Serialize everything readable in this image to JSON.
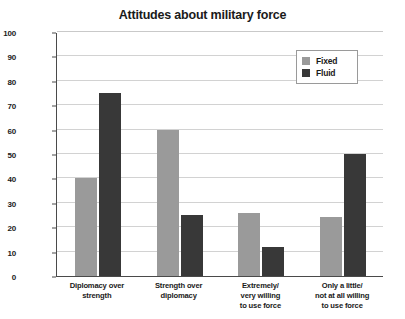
{
  "chart_data": {
    "type": "bar",
    "title": "Attitudes about military force",
    "xlabel": "",
    "ylabel": "Percent",
    "ylim": [
      0,
      100
    ],
    "ytick_step": 10,
    "yticks": [
      0,
      10,
      20,
      30,
      40,
      50,
      60,
      70,
      80,
      90,
      100
    ],
    "grid": true,
    "legend_position": "top-right",
    "categories": [
      "Diplomacy over strength",
      "Strength over diplomacy",
      "Extremely/ very willing to use force",
      "Only a little/ not at all willing to use force"
    ],
    "category_lines": [
      [
        "Diplomacy over",
        "strength"
      ],
      [
        "Strength over",
        "diplomacy"
      ],
      [
        "Extremely/",
        "very willing",
        "to use force"
      ],
      [
        "Only a little/",
        "not at all willing",
        "to use force"
      ]
    ],
    "series": [
      {
        "name": "Fixed",
        "color": "#9a9a9a",
        "values": [
          40,
          60,
          26,
          24
        ]
      },
      {
        "name": "Fluid",
        "color": "#383838",
        "values": [
          75,
          25,
          12,
          50
        ]
      }
    ]
  },
  "legend": {
    "items": [
      {
        "label": "Fixed"
      },
      {
        "label": "Fluid"
      }
    ]
  },
  "colors": {
    "fixed": "#9a9a9a",
    "fluid": "#383838",
    "grid": "#d2d2d2",
    "axis": "#4a4a4a",
    "text": "#1a1a1a",
    "background": "#ffffff"
  }
}
